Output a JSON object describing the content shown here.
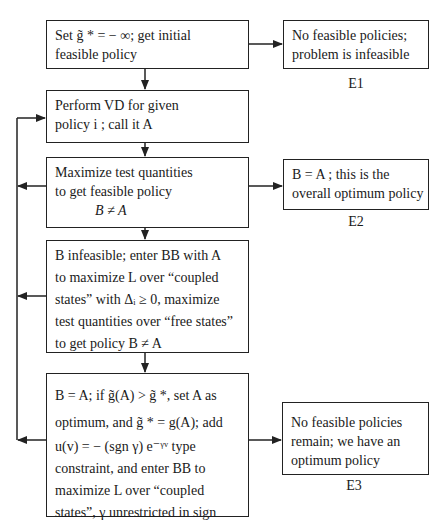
{
  "diagram": {
    "type": "flowchart",
    "colors": {
      "line": "#222222",
      "text": "#1a1a1a",
      "background": "#ffffff"
    },
    "main_boxes": [
      {
        "id": "step1",
        "lines": [
          "Set g̃ * = − ∞; get initial",
          "feasible policy"
        ]
      },
      {
        "id": "step2",
        "lines": [
          "Perform VD for given",
          "policy i ; call it A"
        ]
      },
      {
        "id": "step3",
        "lines": [
          "Maximize test quantities",
          "to get feasible policy",
          "B ≠ A"
        ]
      },
      {
        "id": "step4",
        "lines": [
          "B infeasible;  enter BB with A",
          "to maximize L over  “coupled",
          "states” with Δᵢ ≥ 0, maximize",
          "test  quantities over “free states”",
          "to get policy B ≠ A"
        ]
      },
      {
        "id": "step5",
        "lines": [
          "B = A;  if g̃(A) > g̃ *, set A as",
          "optimum, and g̃ * = g(A);  add",
          "u(v) = − (sgn γ) e⁻ᵞᵛ type",
          "constraint, and enter BB to",
          "maximize   L   over   “coupled",
          "states”, γ unrestricted in sign"
        ]
      }
    ],
    "end_boxes": [
      {
        "id": "E1",
        "label": "E1",
        "lines": [
          "No feasible policies;",
          "problem is infeasible"
        ]
      },
      {
        "id": "E2",
        "label": "E2",
        "lines": [
          "B = A ;  this is the",
          "overall optimum policy"
        ]
      },
      {
        "id": "E3",
        "label": "E3",
        "lines": [
          "No feasible policies",
          "remain; we have an",
          "optimum policy"
        ]
      }
    ],
    "edges": [
      {
        "from": "step1",
        "to": "E1"
      },
      {
        "from": "step1",
        "to": "step2"
      },
      {
        "from": "step2",
        "to": "step3"
      },
      {
        "from": "step3",
        "to": "E2"
      },
      {
        "from": "step3",
        "to": "step2",
        "via": "left feedback loop"
      },
      {
        "from": "step3",
        "to": "step4"
      },
      {
        "from": "step4",
        "to": "step2",
        "via": "left feedback loop"
      },
      {
        "from": "step4",
        "to": "step5"
      },
      {
        "from": "step5",
        "to": "step2",
        "via": "left feedback loop"
      },
      {
        "from": "step5",
        "to": "E3"
      }
    ]
  }
}
